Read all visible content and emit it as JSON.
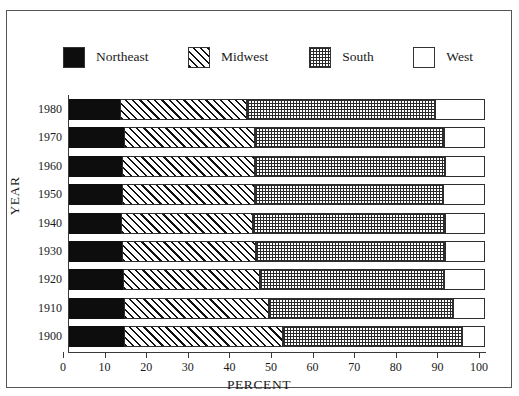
{
  "top_caption": "",
  "legend": {
    "items": [
      {
        "label": "Northeast",
        "pattern": "solid-black",
        "color": "#0d0d0d"
      },
      {
        "label": "Midwest",
        "pattern": "diagonal-hatch",
        "color": "#ffffff"
      },
      {
        "label": "South",
        "pattern": "cross-dotted",
        "color": "#9a9a9a"
      },
      {
        "label": "West",
        "pattern": "empty-white",
        "color": "#ffffff"
      }
    ]
  },
  "axes": {
    "x_title": "PERCENT",
    "y_title": "YEAR",
    "x_ticks": [
      "0",
      "10",
      "20",
      "30",
      "40",
      "50",
      "60",
      "70",
      "80",
      "90",
      "100"
    ]
  },
  "chart_data": {
    "type": "bar",
    "orientation": "horizontal",
    "stacked": true,
    "stack_total": 100,
    "title": "",
    "xlabel": "PERCENT",
    "ylabel": "YEAR",
    "xlim": [
      0,
      100
    ],
    "grid": false,
    "legend_position": "top",
    "categories": [
      "1980",
      "1970",
      "1960",
      "1950",
      "1940",
      "1930",
      "1920",
      "1910",
      "1900"
    ],
    "series": [
      {
        "name": "Northeast",
        "values": [
          12.3,
          13.2,
          12.8,
          12.8,
          12.5,
          12.8,
          13.0,
          13.2,
          13.3
        ]
      },
      {
        "name": "Midwest",
        "values": [
          30.5,
          31.5,
          31.8,
          32.0,
          31.7,
          32.2,
          33.0,
          34.9,
          38.2
        ]
      },
      {
        "name": "South",
        "values": [
          45.2,
          45.5,
          45.7,
          45.1,
          46.3,
          45.5,
          44.2,
          44.2,
          43.0
        ]
      },
      {
        "name": "West",
        "values": [
          12.0,
          9.8,
          9.7,
          10.1,
          9.5,
          9.5,
          9.8,
          7.7,
          5.5
        ]
      }
    ],
    "cumulative_boundaries": [
      {
        "year": "1980",
        "northeast_end": 12.3,
        "midwest_end": 42.8,
        "south_end": 88.0,
        "west_end": 100
      },
      {
        "year": "1970",
        "northeast_end": 13.2,
        "midwest_end": 44.7,
        "south_end": 90.2,
        "west_end": 100
      },
      {
        "year": "1960",
        "northeast_end": 12.8,
        "midwest_end": 44.6,
        "south_end": 90.3,
        "west_end": 100
      },
      {
        "year": "1950",
        "northeast_end": 12.8,
        "midwest_end": 44.8,
        "south_end": 89.9,
        "west_end": 100
      },
      {
        "year": "1940",
        "northeast_end": 12.5,
        "midwest_end": 44.2,
        "south_end": 90.5,
        "west_end": 100
      },
      {
        "year": "1930",
        "northeast_end": 12.8,
        "midwest_end": 45.0,
        "south_end": 90.5,
        "west_end": 100
      },
      {
        "year": "1920",
        "northeast_end": 13.0,
        "midwest_end": 46.0,
        "south_end": 90.2,
        "west_end": 100
      },
      {
        "year": "1910",
        "northeast_end": 13.2,
        "midwest_end": 48.1,
        "south_end": 92.3,
        "west_end": 100
      },
      {
        "year": "1900",
        "northeast_end": 13.3,
        "midwest_end": 51.5,
        "south_end": 94.5,
        "west_end": 100
      }
    ]
  }
}
